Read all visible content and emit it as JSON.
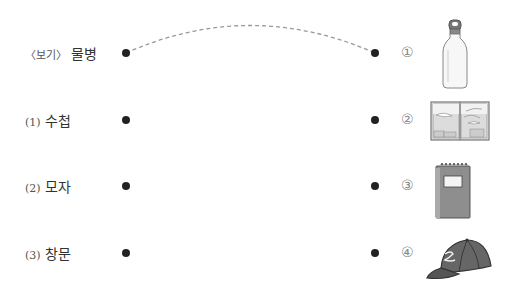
{
  "left_items": [
    {
      "prefix": "〈보기〉",
      "word": "물병"
    },
    {
      "prefix": "(1)",
      "word": "수첩"
    },
    {
      "prefix": "(2)",
      "word": "모자"
    },
    {
      "prefix": "(3)",
      "word": "창문"
    }
  ],
  "right_items": [
    {
      "number": "①",
      "icon": "water-bottle-icon"
    },
    {
      "number": "②",
      "icon": "window-icon"
    },
    {
      "number": "③",
      "icon": "notebook-icon"
    },
    {
      "number": "④",
      "icon": "cap-icon"
    }
  ],
  "example_connection": {
    "from": "〈보기〉 물병",
    "to": "①"
  },
  "colors": {
    "text": "#333333",
    "dot": "#222222",
    "dashed_line": "#999999",
    "circled_number": "#888888"
  }
}
